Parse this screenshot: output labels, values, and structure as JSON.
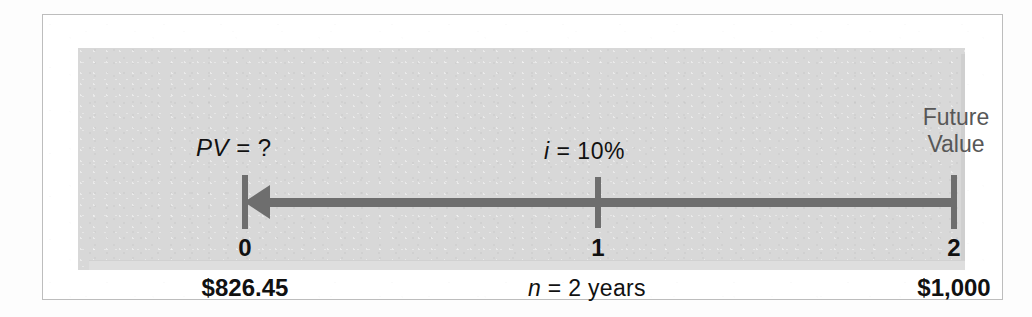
{
  "figure": {
    "type": "time-line-diagram",
    "topic": "present-value-of-a-single-sum"
  },
  "colors": {
    "panel_background": "#d8d8d8",
    "axis": "#6e6e6e",
    "text": "#111111",
    "muted_text": "#575757",
    "frame_border": "#bdbdbd",
    "page_background": "#ffffff"
  },
  "labels": {
    "present_value_var": "PV",
    "present_value_eq": " = ?",
    "interest_var": "i",
    "interest_eq": " = 10%",
    "future_value_line1": "Future",
    "future_value_line2": "Value",
    "periods_var": "n",
    "periods_eq": " = 2 years"
  },
  "timeline": {
    "direction": "right-to-left",
    "arrow_points_to_period": "0",
    "periods": [
      {
        "index": "0",
        "amount": "$826.45"
      },
      {
        "index": "1",
        "amount": ""
      },
      {
        "index": "2",
        "amount": "$1,000"
      }
    ],
    "period_labels": [
      "0",
      "1",
      "2"
    ],
    "amount_present": "$826.45",
    "amount_future": "$1,000"
  },
  "chart_data": {
    "type": "line",
    "xlabel": "Period",
    "ylabel": "",
    "categories": [
      "0",
      "1",
      "2"
    ],
    "x": [
      0,
      1,
      2
    ],
    "values": [
      826.45,
      null,
      1000
    ],
    "annotations": [
      "PV = ?",
      "i = 10%",
      "n = 2 years",
      "Future Value",
      "$826.45",
      "$1,000"
    ],
    "grid": false,
    "legend": "none"
  }
}
